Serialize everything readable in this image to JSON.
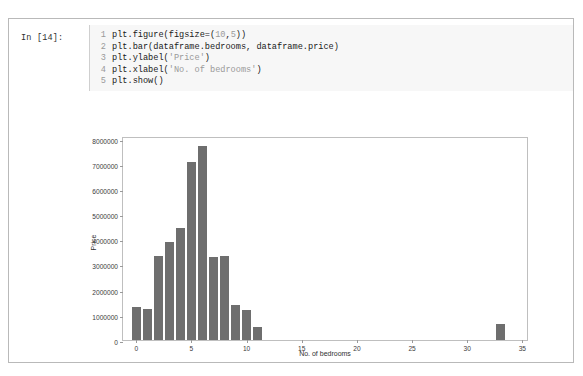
{
  "cell": {
    "prompt_label": "In [14]:",
    "code_lines": [
      {
        "number": "1",
        "text": "plt.figure(figsize=(10,5))"
      },
      {
        "number": "2",
        "text": "plt.bar(dataframe.bedrooms, dataframe.price)"
      },
      {
        "number": "3",
        "text": "plt.ylabel('Price')"
      },
      {
        "number": "4",
        "text": "plt.xlabel('No. of bedrooms')"
      },
      {
        "number": "5",
        "text": "plt.show()"
      }
    ]
  },
  "colors": {
    "bar": "#6e6e6e",
    "axis": "#bfbfbf",
    "tick_text": "#3b3b3b",
    "code_background": "#f7f7f7",
    "cell_border": "#b9b9b9"
  },
  "chart_data": {
    "type": "bar",
    "title": "",
    "xlabel": "No. of bedrooms",
    "ylabel": "Price",
    "x": [
      0,
      1,
      2,
      3,
      4,
      5,
      6,
      7,
      8,
      9,
      10,
      11,
      33
    ],
    "values": [
      1300000,
      1220000,
      3350000,
      3900000,
      4450000,
      7050000,
      7700000,
      3300000,
      3350000,
      1400000,
      1200000,
      500000,
      650000
    ],
    "xlim": [
      -1.2,
      35.6
    ],
    "ylim": [
      0,
      8100000
    ],
    "xticks": [
      0,
      5,
      10,
      15,
      20,
      25,
      30,
      35
    ],
    "xtick_labels": [
      "0",
      "5",
      "10",
      "15",
      "20",
      "25",
      "30",
      "35"
    ],
    "yticks": [
      0,
      1000000,
      2000000,
      3000000,
      4000000,
      5000000,
      6000000,
      7000000,
      8000000
    ],
    "ytick_labels": [
      "0",
      "1000000",
      "2000000",
      "3000000",
      "4000000",
      "5000000",
      "6000000",
      "7000000",
      "8000000"
    ],
    "grid": false,
    "legend": null,
    "bar_width": 0.8
  }
}
